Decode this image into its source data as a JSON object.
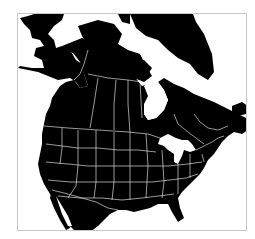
{
  "map": {
    "title": "",
    "region": "North America",
    "style": "black landmass, white political borders",
    "colors": {
      "land": "#000000",
      "water": "#ffffff",
      "borders": "#ffffff",
      "frame": "#c8c8c8"
    },
    "features": [
      "Alaska",
      "Canada",
      "Greenland",
      "Hudson Bay",
      "Great Lakes",
      "United States",
      "Mexico (northern)"
    ]
  }
}
